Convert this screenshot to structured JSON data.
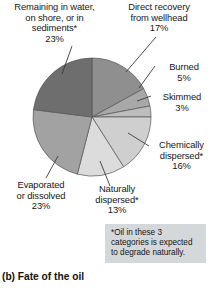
{
  "caption": "(b) Fate of the oil",
  "footnote": "*Oil in these 3 categories is expected to degrade naturally.",
  "labels": {
    "remaining": "Remaining in water,\non shore, or in\nsediments*\n23%",
    "direct": "Direct recovery\nfrom wellhead\n17%",
    "burned": "Burned\n5%",
    "skimmed": "Skimmed\n3%",
    "chemically": "Chemically\ndispersed*\n16%",
    "naturally": "Naturally\ndispersed*\n13%",
    "evaporated": "Evaporated\nor dissolved\n23%"
  },
  "chart_data": {
    "type": "pie",
    "title": "(b) Fate of the oil",
    "xlabel": "",
    "ylabel": "",
    "units": "percent",
    "start_angle_deg": 0,
    "direction": "clockwise",
    "center_px": [
      92,
      117
    ],
    "radius_px": 59,
    "legend": "none (direct labels with leader lines)",
    "categories": [
      "Direct recovery from wellhead",
      "Burned",
      "Skimmed",
      "Chemically dispersed*",
      "Naturally dispersed*",
      "Evaporated or dissolved",
      "Remaining in water, on shore, or in sediments*"
    ],
    "values": [
      17,
      5,
      3,
      16,
      13,
      23,
      23
    ],
    "colors": [
      "#8f8f8f",
      "#a8a8a8",
      "#bdbdbd",
      "#cfcfcf",
      "#dcdcdc",
      "#a2a2a2",
      "#6e6e6e"
    ],
    "footnote": "*Oil in these 3 categories is expected to degrade naturally.",
    "footnote_applies_to": [
      "Chemically dispersed*",
      "Naturally dispersed*",
      "Remaining in water, on shore, or in sediments*"
    ],
    "total": 100
  },
  "style": {
    "pie_outline": "#555555",
    "footnote_bg": "#d4d8da",
    "text_color": "#171717"
  }
}
